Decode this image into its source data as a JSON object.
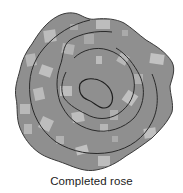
{
  "figure": {
    "caption": "Completed rose",
    "colors": {
      "fill": "#8e8e8e",
      "square_light": "#bdbdbd",
      "square_mid": "#a6a6a6",
      "outline": "#2a2a2a",
      "background": "#ffffff"
    },
    "rings": 4
  }
}
